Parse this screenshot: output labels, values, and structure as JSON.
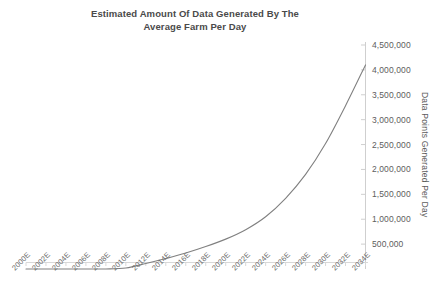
{
  "chart_data": {
    "type": "line",
    "title": "Estimated Amount Of Data Generated By The Average Farm Per Day",
    "title_lines": [
      "Estimated Amount Of Data Generated By The",
      "Average Farm Per Day"
    ],
    "xlabel": "",
    "ylabel": "Data Points Generated Per Day",
    "grid": false,
    "legend": "none",
    "y_axis_position": "right",
    "ylim": [
      0,
      4500000
    ],
    "y_ticks": [
      500000,
      1000000,
      1500000,
      2000000,
      2500000,
      3000000,
      3500000,
      4000000,
      4500000
    ],
    "y_tick_labels": [
      "500,000",
      "1,000,000",
      "1,500,000",
      "2,000,000",
      "2,500,000",
      "3,000,000",
      "3,500,000",
      "4,000,000",
      "4,500,000"
    ],
    "categories": [
      "2000E",
      "2002E",
      "2004E",
      "2006E",
      "2008E",
      "2010E",
      "2012E",
      "2014E",
      "2016E",
      "2018E",
      "2020E",
      "2022E",
      "2024E",
      "2026E",
      "2028E",
      "2030E",
      "2032E",
      "2034E"
    ],
    "series": [
      {
        "name": "Data Points Generated Per Day",
        "color": "#808080",
        "values": [
          0,
          0,
          0,
          0,
          0,
          20000,
          110000,
          210000,
          320000,
          450000,
          600000,
          790000,
          1050000,
          1420000,
          1900000,
          2520000,
          3280000,
          4100000
        ]
      }
    ]
  },
  "colors": {
    "line": "#8c8c8c",
    "axis": "#cfcfcf",
    "tick_text": "#5d5d5d",
    "title_text": "#4a4a4a",
    "background": "#ffffff"
  }
}
